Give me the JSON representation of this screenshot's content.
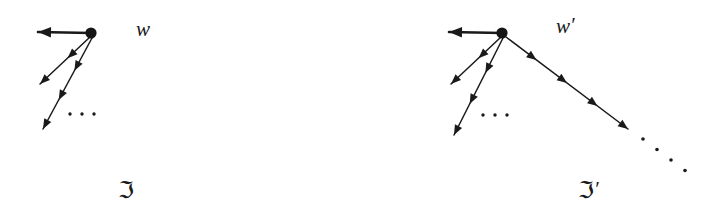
{
  "figure": {
    "background_color": "#ffffff",
    "ink_color": "#1a1a1a",
    "width": 717,
    "height": 222,
    "ellipsis_glyph": "·"
  },
  "diagrams": [
    {
      "id": "left",
      "tree_label": "ℑ",
      "tree_label_prime": "",
      "root_label": "w",
      "root_label_prime": "",
      "root": {
        "x": 91,
        "y": 33,
        "r": 5.6
      },
      "tree_label_pos": {
        "x": 118,
        "y": 198
      },
      "root_label_pos": {
        "x": 136,
        "y": 36
      },
      "ellipsis": {
        "x_start": 70,
        "y": 114,
        "count": 3,
        "gap": 12,
        "r": 1.7
      },
      "edges": [
        {
          "name": "horizontal-edge",
          "weight": "thick",
          "x1": 91,
          "y1": 33,
          "x2": 38,
          "y2": 32,
          "heads": [
            {
              "t": 1.0
            }
          ]
        },
        {
          "name": "short-diagonal-edge",
          "weight": "thin",
          "x1": 90,
          "y1": 37,
          "x2": 40,
          "y2": 84,
          "heads": [
            {
              "t": 0.45
            },
            {
              "t": 1.0
            }
          ]
        },
        {
          "name": "long-diagonal-edge",
          "weight": "thin",
          "x1": 92,
          "y1": 38,
          "x2": 43,
          "y2": 129,
          "heads": [
            {
              "t": 0.36
            },
            {
              "t": 0.68
            },
            {
              "t": 1.0
            }
          ]
        }
      ],
      "trailing_dots": null
    },
    {
      "id": "right",
      "tree_label": "ℑ",
      "tree_label_prime": "′",
      "root_label": "w",
      "root_label_prime": "′",
      "root": {
        "x": 502,
        "y": 33,
        "r": 5.6
      },
      "tree_label_pos": {
        "x": 578,
        "y": 198
      },
      "root_label_pos": {
        "x": 556,
        "y": 33
      },
      "ellipsis": {
        "x_start": 483,
        "y": 115,
        "count": 3,
        "gap": 12,
        "r": 1.7
      },
      "edges": [
        {
          "name": "horizontal-edge",
          "weight": "thick",
          "x1": 502,
          "y1": 33,
          "x2": 449,
          "y2": 32,
          "heads": [
            {
              "t": 1.0
            }
          ]
        },
        {
          "name": "short-diagonal-edge",
          "weight": "thin",
          "x1": 501,
          "y1": 37,
          "x2": 451,
          "y2": 84,
          "heads": [
            {
              "t": 0.45
            },
            {
              "t": 1.0
            }
          ]
        },
        {
          "name": "long-diagonal-edge",
          "weight": "thin",
          "x1": 503,
          "y1": 38,
          "x2": 454,
          "y2": 135,
          "heads": [
            {
              "t": 0.36
            },
            {
              "t": 0.68
            },
            {
              "t": 1.0
            }
          ]
        },
        {
          "name": "descending-chain-edge",
          "weight": "thin",
          "x1": 506,
          "y1": 37,
          "x2": 628,
          "y2": 129,
          "heads": [
            {
              "t": 0.25
            },
            {
              "t": 0.5
            },
            {
              "t": 0.75
            },
            {
              "t": 1.0
            }
          ]
        }
      ],
      "trailing_dots": {
        "name": "chain-continuation-dots",
        "x_start": 643,
        "y_start": 139,
        "dx": 14,
        "dy": 10.5,
        "count": 4,
        "r": 1.8
      }
    }
  ]
}
